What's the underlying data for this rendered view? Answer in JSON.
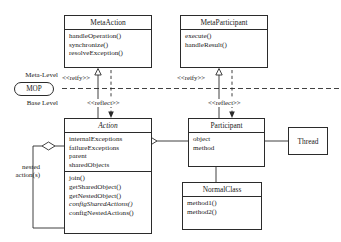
{
  "diagram": {
    "type": "uml-class-diagram",
    "levels": {
      "meta_label": "Meta-Level",
      "base_label": "Base Level",
      "mop_label": "MOP"
    },
    "classes": [
      {
        "id": "metaaction",
        "name": "MetaAction",
        "abstract": false,
        "attributes": [],
        "operations": [
          "handleOperation()",
          "synchronize()",
          "resolveException()"
        ]
      },
      {
        "id": "metaparticipant",
        "name": "MetaParticipant",
        "abstract": false,
        "attributes": [],
        "operations": [
          "execute()",
          "handleResult()"
        ]
      },
      {
        "id": "action",
        "name": "Action",
        "abstract": true,
        "attributes": [
          "internalExceptions",
          "failureExceptions",
          "parent",
          "sharedObjects"
        ],
        "operations": [
          "join()",
          "getSharedObject()",
          "getNestedObject()",
          "configSharedActions()",
          "configNestedActions()"
        ],
        "abstract_operations": [
          "configSharedActions()"
        ]
      },
      {
        "id": "participant",
        "name": "Participant",
        "abstract": false,
        "attributes": [
          "object",
          "method"
        ],
        "operations": []
      },
      {
        "id": "thread",
        "name": "Thread",
        "abstract": false,
        "attributes": [],
        "operations": []
      },
      {
        "id": "normalclass",
        "name": "NormalClass",
        "abstract": false,
        "attributes": [],
        "operations": [
          "method1()",
          "method2()"
        ]
      }
    ],
    "relations": [
      {
        "id": "reify-left",
        "label": "<<reify>>",
        "from": "action",
        "to": "metaaction",
        "style": "solid-hollow-arrow"
      },
      {
        "id": "reflect-left",
        "label": "<<reflect>>",
        "from": "metaaction",
        "to": "action",
        "style": "dashed-arrow"
      },
      {
        "id": "reify-right",
        "label": "<<reify>>",
        "from": "participant",
        "to": "metaparticipant",
        "style": "solid-hollow-arrow"
      },
      {
        "id": "reflect-right",
        "label": "<<reflect>>",
        "from": "metaparticipant",
        "to": "participant",
        "style": "dashed-arrow"
      },
      {
        "id": "nested",
        "label": "nested action(s)",
        "from": "action",
        "to": "action",
        "style": "aggregation-diamond"
      },
      {
        "id": "act-part",
        "label": "",
        "from": "action",
        "to": "participant",
        "style": "aggregation-diamond"
      },
      {
        "id": "part-thread",
        "label": "",
        "from": "participant",
        "to": "thread",
        "style": "association"
      },
      {
        "id": "part-normal",
        "label": "",
        "from": "participant",
        "to": "normalclass",
        "style": "association"
      }
    ],
    "edge_labels": {
      "reify_left": "<<reify>>",
      "reflect_left": "<<reflect>>",
      "reify_right": "<<reify>>",
      "reflect_right": "<<reflect>>",
      "nested": "nested\naction(s)",
      "nested_line1": "nested",
      "nested_line2": "action(s)"
    },
    "colors": {
      "stroke": "#2b2b2b",
      "background": "#ffffff",
      "text": "#1a1a1a"
    }
  }
}
